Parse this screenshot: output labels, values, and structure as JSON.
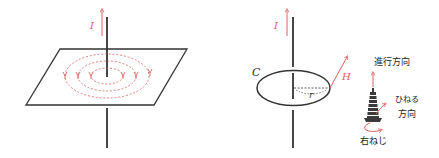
{
  "figure": {
    "left_panel": {
      "current_label": "I",
      "description": "Straight wire through a plane with concentric dashed magnetic field circles"
    },
    "right_panel": {
      "current_label": "I",
      "loop_label": "C",
      "radius_label": "r",
      "field_label": "H",
      "screw": {
        "advance_direction_label": "進行方向",
        "twist_direction_label_line1": "ひねる",
        "twist_direction_label_line2": "方向",
        "screw_label": "右ねじ"
      }
    },
    "colors": {
      "line": "#333333",
      "accent": "#e06060",
      "text": "#222222"
    }
  }
}
